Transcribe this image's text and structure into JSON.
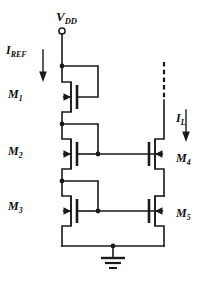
{
  "diagram": {
    "type": "circuit-schematic",
    "background_color": "#ffffff",
    "line_color": "#1a1a1a"
  },
  "labels": {
    "vdd": {
      "base": "V",
      "sub": "DD"
    },
    "iref": {
      "base": "I",
      "sub": "REF"
    },
    "il": {
      "base": "I",
      "sub": "L"
    },
    "m1": {
      "base": "M",
      "sub": "1"
    },
    "m2": {
      "base": "M",
      "sub": "2"
    },
    "m3": {
      "base": "M",
      "sub": "3"
    },
    "m4": {
      "base": "M",
      "sub": "4"
    },
    "m5": {
      "base": "M",
      "sub": "5"
    }
  },
  "components": {
    "transistors": [
      {
        "name": "M1",
        "kind": "nmos",
        "orientation": "gate-right"
      },
      {
        "name": "M2",
        "kind": "nmos",
        "orientation": "gate-right"
      },
      {
        "name": "M3",
        "kind": "nmos",
        "orientation": "gate-right"
      },
      {
        "name": "M4",
        "kind": "nmos",
        "orientation": "gate-left"
      },
      {
        "name": "M5",
        "kind": "nmos",
        "orientation": "gate-left"
      }
    ],
    "terminals": [
      {
        "name": "vdd-terminal",
        "style": "open-circle"
      },
      {
        "name": "ground-symbol",
        "style": "three-bar-ground"
      },
      {
        "name": "load-terminal",
        "style": "dashed-open-line"
      }
    ],
    "current_arrows": [
      {
        "name": "iref-arrow",
        "direction": "down"
      },
      {
        "name": "il-arrow",
        "direction": "down"
      }
    ],
    "junction_nodes": 7
  }
}
